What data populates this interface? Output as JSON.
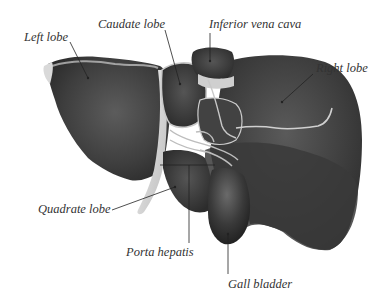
{
  "diagram": {
    "colors": {
      "background": "#ffffff",
      "organ_dark": "#2b2b2b",
      "organ_mid": "#4a4a4a",
      "organ_light": "#6a6a6a",
      "fissure": "#cfcfcf",
      "ligament": "#d9d9d9",
      "label_text": "#333333",
      "leader_line": "#222222"
    },
    "labels": [
      {
        "id": "left-lobe",
        "text": "Left lobe",
        "x": 24,
        "y": 33,
        "anchor": [
          88,
          78
        ]
      },
      {
        "id": "caudate-lobe",
        "text": "Caudate lobe",
        "x": 98,
        "y": 20,
        "anchor": [
          180,
          84
        ]
      },
      {
        "id": "inferior-vena-cava",
        "text": "Inferior vena cava",
        "x": 209,
        "y": 20,
        "anchor": [
          210,
          61
        ]
      },
      {
        "id": "right-lobe",
        "text": "Right lobe",
        "x": 316,
        "y": 63,
        "anchor": [
          282,
          102
        ]
      },
      {
        "id": "quadrate-lobe",
        "text": "Quadrate lobe",
        "x": 38,
        "y": 204,
        "anchor": [
          175,
          187
        ]
      },
      {
        "id": "porta-hepatis",
        "text": "Porta hepatis",
        "x": 126,
        "y": 247,
        "anchor": [
          189,
          165
        ]
      },
      {
        "id": "gall-bladder",
        "text": "Gall bladder",
        "x": 228,
        "y": 279,
        "anchor": [
          228,
          234
        ]
      }
    ]
  }
}
